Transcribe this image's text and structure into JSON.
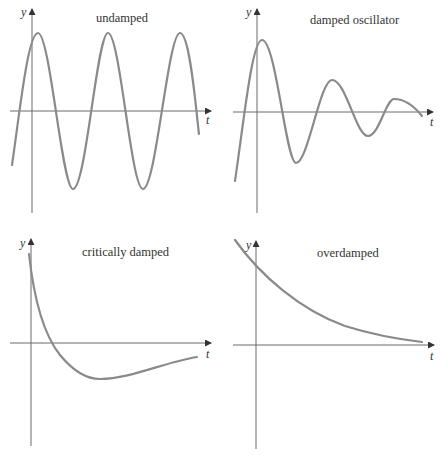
{
  "figure": {
    "panels": [
      {
        "id": "undamped",
        "title": "undamped",
        "xlabel": "t",
        "ylabel": "y"
      },
      {
        "id": "damped",
        "title": "damped oscillator",
        "xlabel": "t",
        "ylabel": "y"
      },
      {
        "id": "critical",
        "title": "critically damped",
        "xlabel": "t",
        "ylabel": "y"
      },
      {
        "id": "overdamped",
        "title": "overdamped",
        "xlabel": "t",
        "ylabel": "y"
      }
    ],
    "colors": {
      "axis": "#6b6b6b",
      "curve": "#8a8a8a",
      "text": "#333333"
    }
  }
}
